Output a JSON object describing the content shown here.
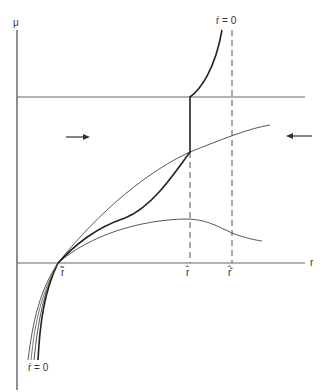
{
  "axes": {
    "y_label": "μ",
    "x_label": "r"
  },
  "curve_labels": {
    "top": "ṙ = 0",
    "bottom": "ṙ = 0"
  },
  "tick_labels": {
    "r_tilde": "r̃",
    "r_hat": "r̂",
    "r_hat_hat": "r̂̂"
  },
  "arrows": {
    "left_direction": "right",
    "right_direction": "left"
  },
  "colors": {
    "line": "#333333",
    "axis": "#444444"
  }
}
